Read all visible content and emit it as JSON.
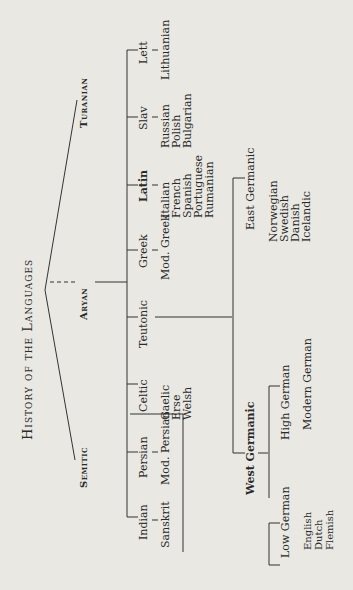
{
  "title": "History of the Languages",
  "roots": {
    "turanian": "Turanian",
    "aryan": "Aryan",
    "semitic": "Semitic"
  },
  "branches": [
    "Indian",
    "Persian",
    "Celtic",
    "Teutonic",
    "Greek",
    "Latin",
    "Slav",
    "Lett"
  ],
  "descendants": {
    "indian": [
      "Sanskrit"
    ],
    "persian": [
      "Mod. Persian"
    ],
    "celtic": [
      "Gaelic",
      "Erse",
      "Welsh"
    ],
    "greek": [
      "Mod. Greek"
    ],
    "latin": [
      "Italian",
      "French",
      "Spanish",
      "Portuguese",
      "Rumanian"
    ],
    "slav": [
      "Russian",
      "Polish",
      "Bulgarian"
    ],
    "lett": [
      "Lithuanian"
    ]
  },
  "teutonic": {
    "west": "West Germanic",
    "east": "East Germanic",
    "low": "Low German",
    "high": "High German",
    "modern_german": "Modern German",
    "low_desc": [
      "English",
      "Dutch",
      "Flemish"
    ],
    "east_desc": [
      "Norwegian",
      "Swedish",
      "Danish",
      "Icelandic"
    ]
  }
}
